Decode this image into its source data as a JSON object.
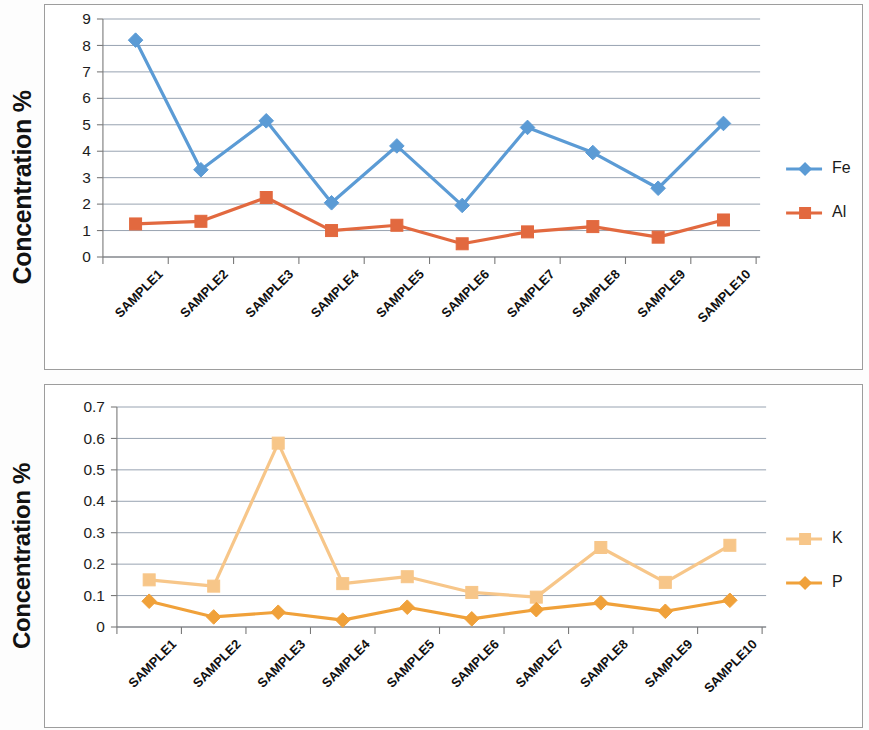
{
  "document": {
    "background_color": "#fdfdfd",
    "chart_count": 2
  },
  "charts": [
    {
      "id": "top",
      "ylabel": "Concentration %",
      "ytick_labels": [
        "9",
        "8",
        "7",
        "6",
        "5",
        "4",
        "3",
        "2",
        "1",
        "0"
      ],
      "legend": [
        {
          "label": "Fe",
          "color": "#5B9BD5",
          "marker": "diamond"
        },
        {
          "label": "Al",
          "color": "#E2693F",
          "marker": "square"
        }
      ]
    },
    {
      "id": "bottom",
      "ylabel": "Concentration %",
      "ytick_labels": [
        "0.7",
        "0.6",
        "0.5",
        "0.4",
        "0.3",
        "0.2",
        "0.1",
        "0"
      ],
      "legend": [
        {
          "label": "K",
          "color": "#F7C689",
          "marker": "square"
        },
        {
          "label": "P",
          "color": "#F0A13A",
          "marker": "diamond"
        }
      ]
    }
  ],
  "chart_data": [
    {
      "type": "line",
      "title": "",
      "xlabel": "",
      "ylabel": "Concentration %",
      "categories": [
        "SAMPLE1",
        "SAMPLE2",
        "SAMPLE3",
        "SAMPLE4",
        "SAMPLE5",
        "SAMPLE6",
        "SAMPLE7",
        "SAMPLE8",
        "SAMPLE9",
        "SAMPLE10"
      ],
      "ylim": [
        0,
        9
      ],
      "ytick_values": [
        0,
        1,
        2,
        3,
        4,
        5,
        6,
        7,
        8,
        9
      ],
      "grid": true,
      "legend_position": "right",
      "series": [
        {
          "name": "Fe",
          "color": "#5B9BD5",
          "marker": "diamond",
          "values": [
            8.2,
            3.3,
            5.15,
            2.05,
            4.2,
            1.95,
            4.9,
            3.95,
            2.6,
            5.05
          ]
        },
        {
          "name": "Al",
          "color": "#E2693F",
          "marker": "square",
          "values": [
            1.25,
            1.35,
            2.25,
            1.0,
            1.2,
            0.5,
            0.95,
            1.15,
            0.75,
            1.4
          ]
        }
      ]
    },
    {
      "type": "line",
      "title": "",
      "xlabel": "",
      "ylabel": "Concentration %",
      "categories": [
        "SAMPLE1",
        "SAMPLE2",
        "SAMPLE3",
        "SAMPLE4",
        "SAMPLE5",
        "SAMPLE6",
        "SAMPLE7",
        "SAMPLE8",
        "SAMPLE9",
        "SAMPLE10"
      ],
      "ylim": [
        0,
        0.7
      ],
      "ytick_values": [
        0,
        0.1,
        0.2,
        0.3,
        0.4,
        0.5,
        0.6,
        0.7
      ],
      "grid": true,
      "legend_position": "right",
      "series": [
        {
          "name": "K",
          "color": "#F7C689",
          "marker": "square",
          "values": [
            0.15,
            0.13,
            0.585,
            0.138,
            0.16,
            0.11,
            0.095,
            0.253,
            0.142,
            0.26
          ]
        },
        {
          "name": "P",
          "color": "#F0A13A",
          "marker": "diamond",
          "values": [
            0.082,
            0.032,
            0.047,
            0.022,
            0.063,
            0.026,
            0.055,
            0.077,
            0.05,
            0.085
          ]
        }
      ]
    }
  ]
}
